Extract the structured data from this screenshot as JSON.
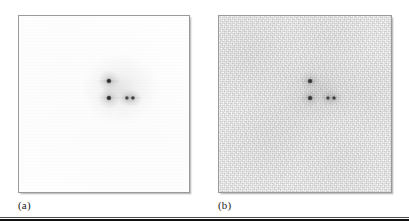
{
  "figure": {
    "kind": "two-panel-diffraction-figure",
    "background_color": "#ffffff",
    "rule_color": "#111111"
  },
  "panels": [
    {
      "id": "panel-a",
      "label": "(a)",
      "frame": {
        "x": 18,
        "y": 15,
        "width": 172,
        "height": 178
      },
      "label_pos": {
        "x": 18,
        "y": 199
      },
      "border_color": "#9a9a9a",
      "plate_color": "#ffffff",
      "noise_level": "low",
      "noise_description": "clean near-white background, almost no speckle"
    },
    {
      "id": "panel-b",
      "label": "(b)",
      "frame": {
        "x": 218,
        "y": 15,
        "width": 174,
        "height": 178
      },
      "label_pos": {
        "x": 218,
        "y": 199
      },
      "border_color": "#9a9a9a",
      "plate_color": "#fcfcfc",
      "noise_level": "high",
      "noise_description": "grainy speckled background, visible random noise"
    }
  ],
  "chart_data": {
    "type": "scatter",
    "title": "",
    "xlabel": "",
    "ylabel": "",
    "grid": false,
    "legend": null,
    "panel_labels": [
      "(a)",
      "(b)"
    ],
    "xlim": [
      0,
      1
    ],
    "ylim": [
      0,
      1
    ],
    "series": [
      {
        "name": "panel-a-spots",
        "panel": "panel-a",
        "points": [
          {
            "name": "top-spot",
            "x": 0.523,
            "y": 0.635,
            "radius_px": 2.6,
            "intensity": 1.0
          },
          {
            "name": "lower-left-spot",
            "x": 0.523,
            "y": 0.54,
            "radius_px": 2.6,
            "intensity": 1.0
          },
          {
            "name": "pair-inner-spot",
            "x": 0.628,
            "y": 0.54,
            "radius_px": 2.1,
            "intensity": 0.92
          },
          {
            "name": "pair-outer-spot",
            "x": 0.663,
            "y": 0.54,
            "radius_px": 2.1,
            "intensity": 0.92
          }
        ]
      },
      {
        "name": "panel-b-spots",
        "panel": "panel-b",
        "points": [
          {
            "name": "top-spot",
            "x": 0.523,
            "y": 0.635,
            "radius_px": 2.4,
            "intensity": 0.95
          },
          {
            "name": "lower-left-spot",
            "x": 0.523,
            "y": 0.54,
            "radius_px": 2.4,
            "intensity": 0.95
          },
          {
            "name": "pair-inner-spot",
            "x": 0.628,
            "y": 0.54,
            "radius_px": 2.0,
            "intensity": 0.88
          },
          {
            "name": "pair-outer-spot",
            "x": 0.663,
            "y": 0.54,
            "radius_px": 2.0,
            "intensity": 0.88
          }
        ]
      }
    ]
  }
}
